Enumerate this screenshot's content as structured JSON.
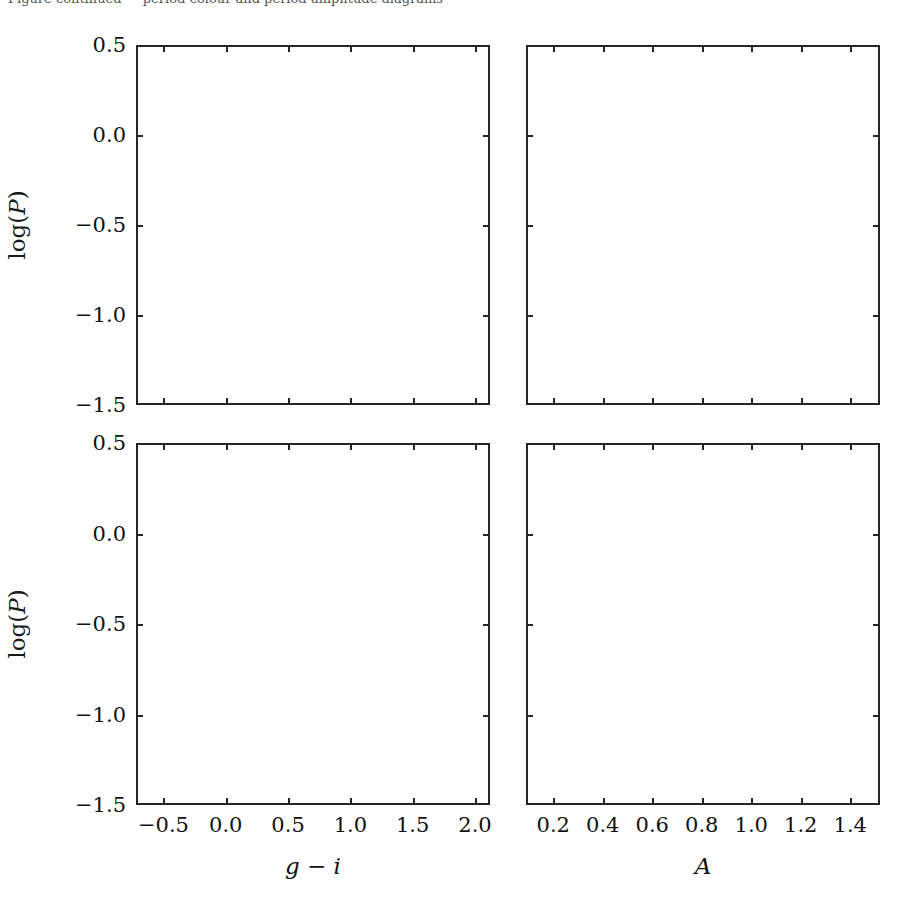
{
  "figure": {
    "clipped_header_text": "Figure continued — period-colour and period-amplitude diagrams",
    "background_color": "#ffffff",
    "axis_color": "#262626",
    "text_color": "#111111",
    "width": 919,
    "height": 916
  },
  "chart_data": {
    "type": "scatter",
    "title": "",
    "subtitle": "",
    "layout": {
      "rows": 2,
      "cols": 2,
      "grid": false,
      "legend": false,
      "legend_position": "none",
      "shared_y": true,
      "shared_x_by_column": true
    },
    "marker": {
      "shape": "circle",
      "size_px": 7,
      "alpha": 0.85
    },
    "palette": {
      "cluster_1_darkest": "#2b2b2b",
      "cluster_2_dark_gray": "#5e5e5e",
      "cluster_3_mid_gray": "#969696",
      "cluster_4_light_gray": "#c9c9c9",
      "cluster_5_scatter_gray": "#8c8c8c"
    },
    "axes": {
      "y": {
        "label": "log(P)",
        "ticks": [
          0.5,
          0.0,
          -0.5,
          -1.0,
          -1.5
        ],
        "ticklabels": [
          "0.5",
          "0.0",
          "−0.5",
          "−1.0",
          "−1.5"
        ],
        "lim": [
          -1.5,
          0.5
        ]
      },
      "x_left": {
        "label": "g − i",
        "ticks": [
          -0.5,
          0.0,
          0.5,
          1.0,
          1.5,
          2.0
        ],
        "ticklabels": [
          "−0.5",
          "0.0",
          "0.5",
          "1.0",
          "1.5",
          "2.0"
        ],
        "lim": [
          -0.72,
          2.12
        ]
      },
      "x_right": {
        "label": "A",
        "ticks": [
          0.2,
          0.4,
          0.6,
          0.8,
          1.0,
          1.2,
          1.4
        ],
        "ticklabels": [
          "0.2",
          "0.4",
          "0.6",
          "0.8",
          "1.0",
          "1.2",
          "1.4"
        ],
        "lim": [
          0.09,
          1.52
        ]
      }
    },
    "panels": [
      {
        "id": "top-left",
        "row": 0,
        "col": 0,
        "xaxis": "x_left",
        "yaxis": "y",
        "seed": 1207,
        "clusters": [
          {
            "name": "RRab-dark-core",
            "color": "#2b2b2b",
            "n": 900,
            "cx": 0.27,
            "cy": -0.205,
            "sx": 0.075,
            "sy": 0.075,
            "rho": 0.15
          },
          {
            "name": "RRab-dark-ext",
            "color": "#2b2b2b",
            "n": 300,
            "cx": 0.34,
            "cy": -0.235,
            "sx": 0.1,
            "sy": 0.06,
            "rho": 0.1
          },
          {
            "name": "RRab-bar-gray",
            "color": "#5e5e5e",
            "n": 950,
            "cx": 0.01,
            "cy": -0.275,
            "sx": 0.175,
            "sy": 0.055,
            "rho": 0.1
          },
          {
            "name": "RRc-light",
            "color": "#c9c9c9",
            "n": 1000,
            "cx": 0.03,
            "cy": -0.505,
            "sx": 0.175,
            "sy": 0.055,
            "rho": 0.0
          },
          {
            "name": "RRc-mid",
            "color": "#969696",
            "n": 1150,
            "cx": 0.7,
            "cy": -0.545,
            "sx": 0.34,
            "sy": 0.058,
            "rho": 0.0
          },
          {
            "name": "field-scatter",
            "color": "#8c8c8c",
            "n": 620,
            "cx": 0.95,
            "cy": -0.1,
            "sx": 0.52,
            "sy": 0.28,
            "rho": 0.0
          },
          {
            "name": "sx-phe-clump",
            "color": "#3a3a3a",
            "n": 120,
            "cx": 0.05,
            "cy": -1.2,
            "sx": 0.085,
            "sy": 0.065,
            "rho": 0.45
          }
        ]
      },
      {
        "id": "top-right",
        "row": 0,
        "col": 1,
        "xaxis": "x_right",
        "yaxis": "y",
        "seed": 4411,
        "clusters": [
          {
            "name": "RRab-dark-band",
            "color": "#2b2b2b",
            "n": 1500,
            "cx": 0.62,
            "cy": -0.245,
            "sx": 0.215,
            "sy": 0.055,
            "rho": -0.38
          },
          {
            "name": "RRab-dark-taper",
            "color": "#2b2b2b",
            "n": 420,
            "cx": 0.92,
            "cy": -0.3,
            "sx": 0.145,
            "sy": 0.03,
            "rho": -0.25
          },
          {
            "name": "RRab-upper",
            "color": "#5e5e5e",
            "n": 380,
            "cx": 0.5,
            "cy": -0.13,
            "sx": 0.15,
            "sy": 0.065,
            "rho": 0.0
          },
          {
            "name": "RRc-light",
            "color": "#c9c9c9",
            "n": 520,
            "cx": 0.47,
            "cy": -0.475,
            "sx": 0.16,
            "sy": 0.038,
            "rho": 0.0
          },
          {
            "name": "RRc-mid",
            "color": "#969696",
            "n": 1250,
            "cx": 0.5,
            "cy": -0.565,
            "sx": 0.175,
            "sy": 0.055,
            "rho": 0.0
          },
          {
            "name": "field-scatter",
            "color": "#8c8c8c",
            "n": 300,
            "cx": 0.62,
            "cy": -0.25,
            "sx": 0.3,
            "sy": 0.3,
            "rho": 0.0
          },
          {
            "name": "sx-phe-clump",
            "color": "#3a3a3a",
            "n": 115,
            "cx": 0.52,
            "cy": -1.205,
            "sx": 0.115,
            "sy": 0.06,
            "rho": 0.05
          }
        ]
      },
      {
        "id": "bottom-left",
        "row": 1,
        "col": 0,
        "xaxis": "x_left",
        "yaxis": "y",
        "seed": 8823,
        "clusters": [
          {
            "name": "RRab-dark-core",
            "color": "#2b2b2b",
            "n": 620,
            "cx": 0.25,
            "cy": -0.185,
            "sx": 0.085,
            "sy": 0.072,
            "rho": 0.15
          },
          {
            "name": "RRab-bar-gray",
            "color": "#5e5e5e",
            "n": 900,
            "cx": -0.02,
            "cy": -0.265,
            "sx": 0.175,
            "sy": 0.062,
            "rho": 0.1
          },
          {
            "name": "RRc-light",
            "color": "#c9c9c9",
            "n": 1000,
            "cx": 0.22,
            "cy": -0.515,
            "sx": 0.235,
            "sy": 0.065,
            "rho": 0.0
          },
          {
            "name": "RRc-mid",
            "color": "#969696",
            "n": 950,
            "cx": 0.85,
            "cy": -0.575,
            "sx": 0.36,
            "sy": 0.062,
            "rho": 0.0
          },
          {
            "name": "field-scatter",
            "color": "#8c8c8c",
            "n": 900,
            "cx": 0.95,
            "cy": -0.2,
            "sx": 0.56,
            "sy": 0.3,
            "rho": 0.0
          },
          {
            "name": "sx-phe-clump",
            "color": "#3a3a3a",
            "n": 115,
            "cx": 0.06,
            "cy": -1.205,
            "sx": 0.085,
            "sy": 0.07,
            "rho": 0.45
          }
        ]
      },
      {
        "id": "bottom-right",
        "row": 1,
        "col": 1,
        "xaxis": "x_right",
        "yaxis": "y",
        "seed": 9157,
        "clusters": [
          {
            "name": "RRab-dark-band",
            "color": "#2b2b2b",
            "n": 1250,
            "cx": 0.63,
            "cy": -0.235,
            "sx": 0.215,
            "sy": 0.055,
            "rho": -0.38
          },
          {
            "name": "RRab-dark-taper",
            "color": "#2b2b2b",
            "n": 380,
            "cx": 0.93,
            "cy": -0.295,
            "sx": 0.14,
            "sy": 0.03,
            "rho": -0.25
          },
          {
            "name": "RRab-upper",
            "color": "#5e5e5e",
            "n": 300,
            "cx": 0.52,
            "cy": -0.115,
            "sx": 0.16,
            "sy": 0.07,
            "rho": 0.0
          },
          {
            "name": "RRc-light",
            "color": "#c9c9c9",
            "n": 560,
            "cx": 0.46,
            "cy": -0.475,
            "sx": 0.165,
            "sy": 0.042,
            "rho": 0.0
          },
          {
            "name": "RRc-mid",
            "color": "#969696",
            "n": 1100,
            "cx": 0.5,
            "cy": -0.57,
            "sx": 0.185,
            "sy": 0.058,
            "rho": 0.0
          },
          {
            "name": "field-scatter",
            "color": "#8c8c8c",
            "n": 340,
            "cx": 0.62,
            "cy": -0.27,
            "sx": 0.32,
            "sy": 0.31,
            "rho": 0.0
          },
          {
            "name": "sx-phe-clump",
            "color": "#3a3a3a",
            "n": 110,
            "cx": 0.52,
            "cy": -1.215,
            "sx": 0.115,
            "sy": 0.06,
            "rho": 0.05
          }
        ]
      }
    ]
  },
  "geometry": {
    "panels": [
      {
        "id": "top-left",
        "left": 136,
        "top": 45,
        "width": 354,
        "height": 360
      },
      {
        "id": "top-right",
        "left": 526,
        "top": 45,
        "width": 354,
        "height": 360
      },
      {
        "id": "bottom-left",
        "left": 136,
        "top": 443,
        "width": 354,
        "height": 362
      },
      {
        "id": "bottom-right",
        "left": 526,
        "top": 443,
        "width": 354,
        "height": 362
      }
    ]
  }
}
